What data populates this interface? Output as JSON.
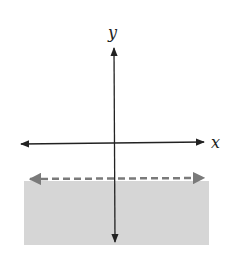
{
  "figure": {
    "type": "coordinate-plane-inequality-graph",
    "x_axis_label": "x",
    "y_axis_label": "y",
    "boundary_line": {
      "style": "dashed",
      "orientation": "horizontal",
      "position": "below x-axis",
      "color": "#7a7a7a"
    },
    "shaded_region": {
      "side": "below boundary line",
      "color": "#d6d6d6"
    },
    "axis_color": "#222222"
  }
}
